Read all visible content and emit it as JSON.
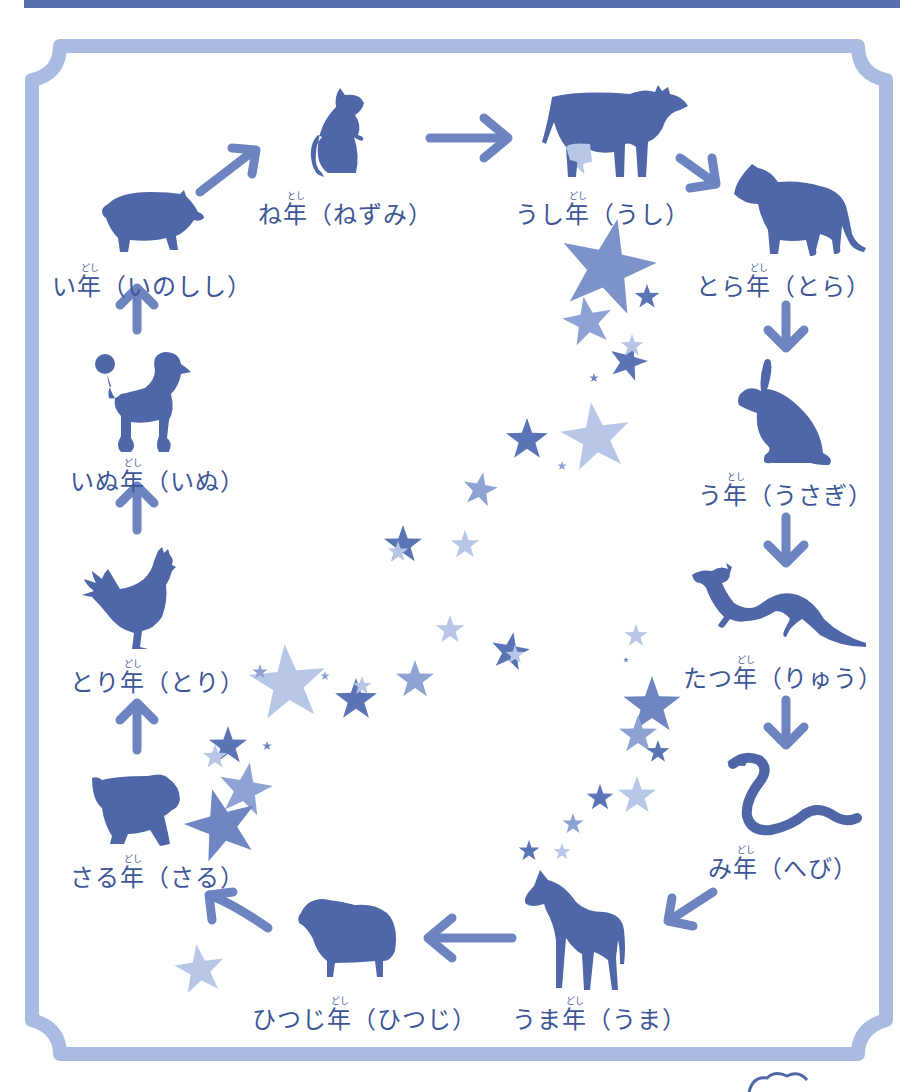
{
  "diagram": {
    "colors": {
      "frame": "#a9bbe0",
      "animal": "#4f67a8",
      "text": "#3d5697",
      "arrow": "#6d84c0",
      "star_dark": "#5b74b5",
      "star_mid": "#8ea2d4",
      "star_light": "#b8c6e8",
      "top_bar": "#5770ad"
    },
    "ruby": "とし",
    "ruby_alt": "どし",
    "nodes": [
      {
        "id": "ne",
        "animal": "rat",
        "prefix": "ね",
        "kanji": "年",
        "ruby": "とし",
        "reading": "（ねずみ）"
      },
      {
        "id": "ushi",
        "animal": "ox",
        "prefix": "うし",
        "kanji": "年",
        "ruby": "どし",
        "reading": "（うし）"
      },
      {
        "id": "tora",
        "animal": "tiger",
        "prefix": "とら",
        "kanji": "年",
        "ruby": "どし",
        "reading": "（とら）"
      },
      {
        "id": "u",
        "animal": "rabbit",
        "prefix": "う",
        "kanji": "年",
        "ruby": "とし",
        "reading": "（うさぎ）"
      },
      {
        "id": "tatsu",
        "animal": "dragon",
        "prefix": "たつ",
        "kanji": "年",
        "ruby": "どし",
        "reading": "（りゅう）"
      },
      {
        "id": "mi",
        "animal": "snake",
        "prefix": "み",
        "kanji": "年",
        "ruby": "どし",
        "reading": "（へび）"
      },
      {
        "id": "uma",
        "animal": "horse",
        "prefix": "うま",
        "kanji": "年",
        "ruby": "どし",
        "reading": "（うま）"
      },
      {
        "id": "hitsuji",
        "animal": "sheep",
        "prefix": "ひつじ",
        "kanji": "年",
        "ruby": "どし",
        "reading": "（ひつじ）"
      },
      {
        "id": "saru",
        "animal": "monkey",
        "prefix": "さる",
        "kanji": "年",
        "ruby": "どし",
        "reading": "（さる）"
      },
      {
        "id": "tori",
        "animal": "rooster",
        "prefix": "とり",
        "kanji": "年",
        "ruby": "どし",
        "reading": "（とり）"
      },
      {
        "id": "inu",
        "animal": "dog",
        "prefix": "いぬ",
        "kanji": "年",
        "ruby": "どし",
        "reading": "（いぬ）"
      },
      {
        "id": "i",
        "animal": "boar",
        "prefix": "い",
        "kanji": "年",
        "ruby": "どし",
        "reading": "（いのしし）"
      }
    ],
    "cycle_order": [
      "ne",
      "ushi",
      "tora",
      "u",
      "tatsu",
      "mi",
      "uma",
      "hitsuji",
      "saru",
      "tori",
      "inu",
      "i"
    ]
  }
}
